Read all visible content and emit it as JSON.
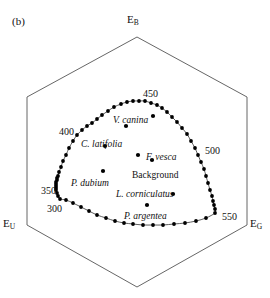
{
  "figure": {
    "panel_label": "(b)",
    "type": "color-hexagon-chromaticity-diagram",
    "stroke_color": "#555555",
    "point_color": "#000000",
    "background_color": "#ffffff"
  },
  "vertices": {
    "top": {
      "base": "E",
      "sub": "B"
    },
    "bottom_left": {
      "base": "E",
      "sub": "U"
    },
    "bottom_right": {
      "base": "E",
      "sub": "G"
    }
  },
  "wavelength_labels": [
    {
      "text": "450",
      "x": 143,
      "y": 89
    },
    {
      "text": "400",
      "x": 59,
      "y": 127
    },
    {
      "text": "500",
      "x": 205,
      "y": 146
    },
    {
      "text": "350",
      "x": 41,
      "y": 186
    },
    {
      "text": "300",
      "x": 47,
      "y": 204
    },
    {
      "text": "550",
      "x": 222,
      "y": 212
    }
  ],
  "sample_labels": [
    {
      "text": "V. canina",
      "style": "italic",
      "x": 113,
      "y": 116
    },
    {
      "text": "C. latifolia",
      "style": "italic",
      "x": 81,
      "y": 140
    },
    {
      "text": "F. vesca",
      "style": "italic",
      "x": 146,
      "y": 153
    },
    {
      "text": "Background",
      "style": "plain",
      "x": 132,
      "y": 171
    },
    {
      "text": "P. dubium",
      "style": "italic",
      "x": 71,
      "y": 179
    },
    {
      "text": "L. corniculatus",
      "style": "italic",
      "x": 116,
      "y": 190
    },
    {
      "text": "P. argentea",
      "style": "italic",
      "x": 124,
      "y": 212
    }
  ],
  "chart_data": {
    "type": "scatter",
    "title": "",
    "subtitle": "",
    "xlabel": "",
    "ylabel": "",
    "grid": false,
    "legend": "none",
    "axes_note": "Hexagonal bee colour space; vertices are the three photoreceptor excitation axes E_B (top), E_U (lower-left), E_G (lower-right).",
    "hexagon_vertices": [
      {
        "name": "E_B",
        "x": 137,
        "y": 37
      },
      {
        "name": "upper-right",
        "x": 247,
        "y": 97
      },
      {
        "name": "E_G",
        "x": 247,
        "y": 225
      },
      {
        "name": "bottom",
        "x": 137,
        "y": 287
      },
      {
        "name": "E_U",
        "x": 27,
        "y": 225
      },
      {
        "name": "upper-left",
        "x": 27,
        "y": 97
      }
    ],
    "series": [
      {
        "name": "spectral locus",
        "marker": "filled-circle",
        "connected": true,
        "wavelength_start": 300,
        "wavelength_end": 550,
        "points": [
          {
            "wl": 300,
            "x": 60,
            "y": 199
          },
          {
            "wl": 305,
            "x": 58,
            "y": 196
          },
          {
            "wl": 310,
            "x": 57,
            "y": 193
          },
          {
            "wl": 315,
            "x": 56,
            "y": 190
          },
          {
            "wl": 320,
            "x": 56,
            "y": 188
          },
          {
            "wl": 325,
            "x": 56,
            "y": 186
          },
          {
            "wl": 330,
            "x": 56,
            "y": 184
          },
          {
            "wl": 335,
            "x": 56,
            "y": 182
          },
          {
            "wl": 340,
            "x": 57,
            "y": 180
          },
          {
            "wl": 345,
            "x": 57,
            "y": 178
          },
          {
            "wl": 350,
            "x": 58,
            "y": 176
          },
          {
            "wl": 355,
            "x": 59,
            "y": 172
          },
          {
            "wl": 360,
            "x": 61,
            "y": 167
          },
          {
            "wl": 365,
            "x": 63,
            "y": 161
          },
          {
            "wl": 370,
            "x": 66,
            "y": 155
          },
          {
            "wl": 375,
            "x": 69,
            "y": 148
          },
          {
            "wl": 380,
            "x": 73,
            "y": 141
          },
          {
            "wl": 385,
            "x": 77,
            "y": 135
          },
          {
            "wl": 390,
            "x": 82,
            "y": 130
          },
          {
            "wl": 395,
            "x": 87,
            "y": 126
          },
          {
            "wl": 400,
            "x": 92,
            "y": 123
          },
          {
            "wl": 405,
            "x": 97,
            "y": 119
          },
          {
            "wl": 410,
            "x": 102,
            "y": 115
          },
          {
            "wl": 415,
            "x": 108,
            "y": 111
          },
          {
            "wl": 420,
            "x": 114,
            "y": 107
          },
          {
            "wl": 425,
            "x": 121,
            "y": 104
          },
          {
            "wl": 430,
            "x": 127,
            "y": 102
          },
          {
            "wl": 435,
            "x": 133,
            "y": 101
          },
          {
            "wl": 440,
            "x": 139,
            "y": 101
          },
          {
            "wl": 445,
            "x": 145,
            "y": 101
          },
          {
            "wl": 450,
            "x": 151,
            "y": 103
          },
          {
            "wl": 455,
            "x": 157,
            "y": 105
          },
          {
            "wl": 460,
            "x": 162,
            "y": 108
          },
          {
            "wl": 465,
            "x": 167,
            "y": 112
          },
          {
            "wl": 470,
            "x": 172,
            "y": 117
          },
          {
            "wl": 475,
            "x": 177,
            "y": 122
          },
          {
            "wl": 480,
            "x": 182,
            "y": 128
          },
          {
            "wl": 485,
            "x": 187,
            "y": 134
          },
          {
            "wl": 490,
            "x": 191,
            "y": 141
          },
          {
            "wl": 495,
            "x": 195,
            "y": 148
          },
          {
            "wl": 500,
            "x": 198,
            "y": 155
          },
          {
            "wl": 505,
            "x": 201,
            "y": 162
          },
          {
            "wl": 510,
            "x": 204,
            "y": 169
          },
          {
            "wl": 515,
            "x": 206,
            "y": 176
          },
          {
            "wl": 520,
            "x": 208,
            "y": 183
          },
          {
            "wl": 525,
            "x": 210,
            "y": 190
          },
          {
            "wl": 530,
            "x": 212,
            "y": 196
          },
          {
            "wl": 535,
            "x": 213,
            "y": 201
          },
          {
            "wl": 540,
            "x": 214,
            "y": 205
          },
          {
            "wl": 545,
            "x": 215,
            "y": 209
          },
          {
            "wl": 550,
            "x": 215,
            "y": 213
          },
          {
            "wl": null,
            "x": 206,
            "y": 218
          },
          {
            "wl": null,
            "x": 196,
            "y": 221
          },
          {
            "wl": null,
            "x": 185,
            "y": 223
          },
          {
            "wl": null,
            "x": 174,
            "y": 224
          },
          {
            "wl": null,
            "x": 163,
            "y": 225
          },
          {
            "wl": null,
            "x": 153,
            "y": 225
          },
          {
            "wl": null,
            "x": 143,
            "y": 225
          },
          {
            "wl": null,
            "x": 133,
            "y": 224
          },
          {
            "wl": null,
            "x": 124,
            "y": 223
          },
          {
            "wl": null,
            "x": 115,
            "y": 221
          },
          {
            "wl": null,
            "x": 106,
            "y": 218
          },
          {
            "wl": null,
            "x": 97,
            "y": 215
          },
          {
            "wl": null,
            "x": 89,
            "y": 211
          },
          {
            "wl": null,
            "x": 81,
            "y": 207
          },
          {
            "wl": null,
            "x": 73,
            "y": 203
          },
          {
            "wl": null,
            "x": 66,
            "y": 200
          }
        ]
      },
      {
        "name": "flower and background loci",
        "marker": "filled-circle",
        "connected": false,
        "points": [
          {
            "label": "V. canina",
            "x": 153,
            "y": 116
          },
          {
            "label": "V. canina point",
            "x": 126,
            "y": 126
          },
          {
            "label": "C. latifolia",
            "x": 105,
            "y": 146
          },
          {
            "label": "F. vesca",
            "x": 138,
            "y": 155
          },
          {
            "label": "Background",
            "x": 152,
            "y": 160
          },
          {
            "label": "P. dubium",
            "x": 103,
            "y": 171
          },
          {
            "label": "L. corniculatus",
            "x": 173,
            "y": 194
          },
          {
            "label": "P. argentea",
            "x": 147,
            "y": 205
          }
        ]
      }
    ]
  }
}
